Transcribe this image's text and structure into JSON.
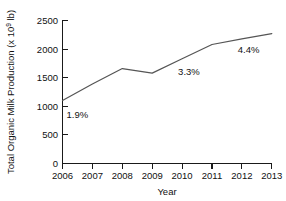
{
  "chart_data": {
    "type": "line",
    "title": "",
    "xlabel": "Year",
    "ylabel": "Total Organic Milk Production (x 10",
    "ylabel_exponent": "9",
    "ylabel_suffix": " lb)",
    "categories": [
      "2006",
      "2007",
      "2008",
      "2009",
      "2010",
      "2011",
      "2012",
      "2013"
    ],
    "x": [
      2006,
      2007,
      2008,
      2009,
      2010,
      2011,
      2012,
      2013
    ],
    "values": [
      1100,
      1390,
      1660,
      1580,
      1830,
      2080,
      2180,
      2270
    ],
    "series": [
      {
        "name": "Total Organic Milk Production",
        "values": [
          1100,
          1390,
          1660,
          1580,
          1830,
          2080,
          2180,
          2270
        ],
        "color": "#555555"
      }
    ],
    "ylim": [
      0,
      2500
    ],
    "xlim": [
      2006,
      2013
    ],
    "yticks": [
      "0",
      "500",
      "1000",
      "1500",
      "2000",
      "2500"
    ],
    "ytick_values": [
      0,
      500,
      1000,
      1500,
      2000,
      2500
    ],
    "xticks": [
      "2006",
      "2007",
      "2008",
      "2009",
      "2010",
      "2011",
      "2012",
      "2013"
    ],
    "grid": false,
    "legend": false,
    "legend_position": "none",
    "annotations": [
      {
        "text": "1.9%",
        "x": 2006,
        "y": 1100,
        "dx": 4,
        "dy": 17
      },
      {
        "text": "3.3%",
        "x": 2010,
        "y": 1830,
        "dx": -4,
        "dy": 16
      },
      {
        "text": "4.4%",
        "x": 2013,
        "y": 2270,
        "dx": -34,
        "dy": 19
      }
    ]
  },
  "axes": {
    "y_tick_0": "0",
    "y_tick_1": "500",
    "y_tick_2": "1000",
    "y_tick_3": "1500",
    "y_tick_4": "2000",
    "y_tick_5": "2500",
    "x_tick_0": "2006",
    "x_tick_1": "2007",
    "x_tick_2": "2008",
    "x_tick_3": "2009",
    "x_tick_4": "2010",
    "x_tick_5": "2011",
    "x_tick_6": "2012",
    "x_tick_7": "2013",
    "x_axis_title": "Year",
    "y_axis_title_main": "Total Organic Milk Production (x 10",
    "y_axis_title_exp": "9",
    "y_axis_title_tail": " lb)"
  },
  "annotations": {
    "a0": "1.9%",
    "a1": "3.3%",
    "a2": "4.4%"
  },
  "colors": {
    "line": "#555555",
    "axis": "#1a1a1a",
    "text": "#111111",
    "background": "#ffffff"
  }
}
